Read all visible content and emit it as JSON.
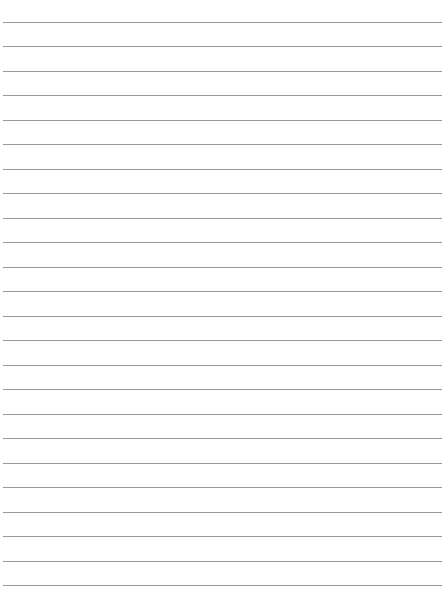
{
  "page": {
    "type": "lined-paper",
    "background": "#ffffff",
    "line_color": "#9a9a9a",
    "line_count": 24,
    "first_line_y": 22,
    "line_spacing": 24.48,
    "line_left": 3,
    "line_right": 442
  }
}
